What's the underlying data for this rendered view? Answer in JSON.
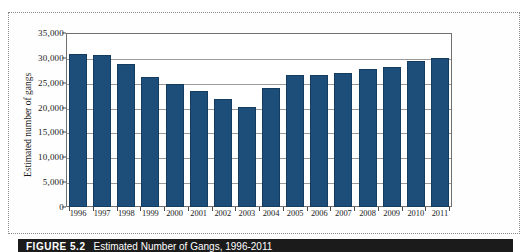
{
  "figure": {
    "caption_label": "FIGURE 5.2",
    "caption_title": "Estimated Number of Gangs, 1996-2011"
  },
  "colors": {
    "bar_fill": "#1d4e79",
    "bar_stroke": "#143c5e",
    "gridline": "#9a9a9a",
    "axis": "#6f6f6f",
    "caption_background": "#1b1b1b",
    "caption_text": "#ffffff"
  },
  "chart_data": {
    "type": "bar",
    "title": "Estimated Number of Gangs, 1996-2011",
    "xlabel": "",
    "ylabel": "Estimated number of gangs",
    "ylim": [
      0,
      35000
    ],
    "grid": true,
    "legend": null,
    "categories": [
      "1996",
      "1997",
      "1998",
      "1999",
      "2000",
      "2001",
      "2002",
      "2003",
      "2004",
      "2005",
      "2006",
      "2007",
      "2008",
      "2009",
      "2010",
      "2011"
    ],
    "values": [
      30800,
      30500,
      28700,
      26100,
      24700,
      23400,
      21700,
      20100,
      24000,
      26500,
      26500,
      27000,
      27700,
      28100,
      29400,
      29900
    ],
    "ytick_labels": [
      "0",
      "5,000",
      "10,000",
      "15,000",
      "20,000",
      "25,000",
      "30,000",
      "35,000"
    ],
    "ytick_values": [
      0,
      5000,
      10000,
      15000,
      20000,
      25000,
      30000,
      35000
    ],
    "xtick_labels": [
      "1996",
      "1997",
      "1998",
      "1999",
      "2000",
      "2001",
      "2002",
      "2003",
      "2004",
      "2005",
      "2006",
      "2007",
      "2008",
      "2009",
      "2010",
      "2011"
    ]
  }
}
